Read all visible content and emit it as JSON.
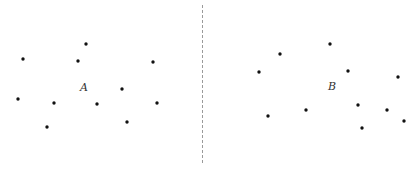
{
  "diagram": {
    "width": 419,
    "height": 173,
    "divider": {
      "x": 202,
      "y1": 5,
      "y2": 165,
      "color": "#9a9a9a"
    },
    "panels": [
      {
        "name": "A",
        "label": "A",
        "label_pos": {
          "x": 80,
          "y": 91
        },
        "points": [
          {
            "x": 23,
            "y": 59
          },
          {
            "x": 86,
            "y": 44
          },
          {
            "x": 78,
            "y": 61
          },
          {
            "x": 153,
            "y": 62
          },
          {
            "x": 18,
            "y": 99
          },
          {
            "x": 54,
            "y": 103
          },
          {
            "x": 97,
            "y": 104
          },
          {
            "x": 122,
            "y": 89
          },
          {
            "x": 157,
            "y": 103
          },
          {
            "x": 47,
            "y": 127
          },
          {
            "x": 127,
            "y": 122
          }
        ]
      },
      {
        "name": "B",
        "label": "B",
        "label_pos": {
          "x": 328,
          "y": 90
        },
        "points": [
          {
            "x": 280,
            "y": 54
          },
          {
            "x": 330,
            "y": 44
          },
          {
            "x": 259,
            "y": 72
          },
          {
            "x": 348,
            "y": 71
          },
          {
            "x": 398,
            "y": 77
          },
          {
            "x": 268,
            "y": 116
          },
          {
            "x": 306,
            "y": 110
          },
          {
            "x": 358,
            "y": 105
          },
          {
            "x": 387,
            "y": 110
          },
          {
            "x": 404,
            "y": 121
          },
          {
            "x": 362,
            "y": 128
          }
        ]
      }
    ],
    "dot_color": "#111111",
    "dot_radius": 1.7
  }
}
